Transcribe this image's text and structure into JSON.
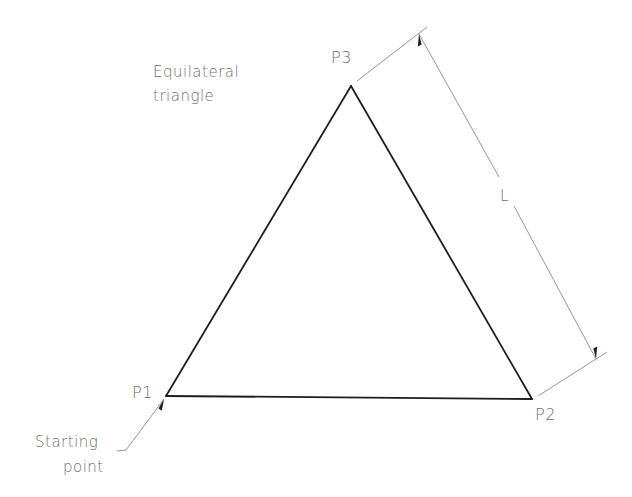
{
  "diagram": {
    "title": "Equilateral triangle",
    "note_lines": [
      "Equilateral",
      "triangle"
    ],
    "vertices": [
      {
        "id": "P1",
        "label": "P1",
        "x": 166,
        "y": 396
      },
      {
        "id": "P2",
        "label": "P2",
        "x": 532,
        "y": 399
      },
      {
        "id": "P3",
        "label": "P3",
        "x": 351,
        "y": 86
      }
    ],
    "dimension": {
      "label": "L",
      "meaning": "side length",
      "between": [
        "P3",
        "P2"
      ]
    },
    "start_note_lines": [
      "Starting",
      "point"
    ],
    "start_vertex": "P1",
    "colors": {
      "edge": "#1e1e1e",
      "annotation": "#8a8a8a",
      "text": "#6e6e6e",
      "background": "#ffffff"
    }
  }
}
